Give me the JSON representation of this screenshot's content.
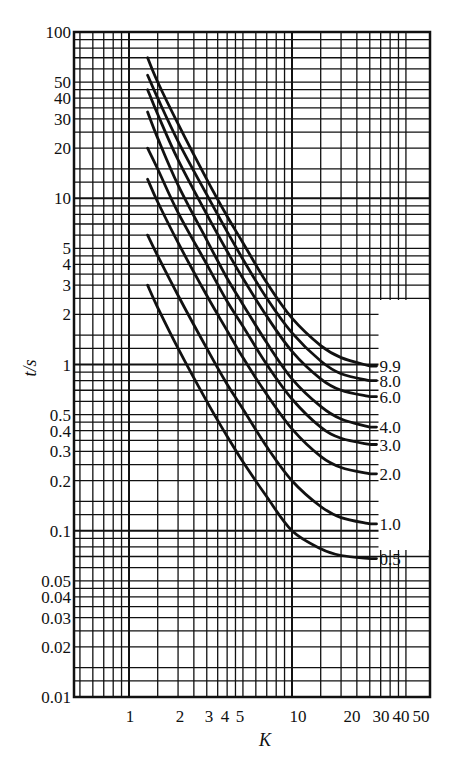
{
  "chart_data": {
    "type": "line",
    "title": "",
    "xlabel": "K",
    "ylabel": "t/s",
    "xscale": "log",
    "yscale": "log",
    "xlim": [
      0.45,
      50
    ],
    "ylim": [
      0.01,
      100
    ],
    "grid": true,
    "legend_position": "inline-right",
    "x_ticks": [
      1,
      2,
      3,
      4,
      5,
      10,
      20,
      30,
      40,
      50
    ],
    "x_tick_labels": [
      "1",
      "2",
      "3",
      "4",
      "5",
      "10",
      "20",
      "30",
      "40",
      "50"
    ],
    "y_ticks": [
      100,
      50,
      40,
      30,
      20,
      10,
      5,
      4,
      3,
      2,
      1,
      0.5,
      0.4,
      0.3,
      0.2,
      0.1,
      0.05,
      0.04,
      0.03,
      0.02,
      0.01
    ],
    "y_tick_labels": [
      "100",
      "50",
      "40",
      "30",
      "20",
      "10",
      "5",
      "4",
      "3",
      "2",
      "1",
      "0.5",
      "0.4",
      "0.3",
      "0.2",
      "0.1",
      "0.05",
      "0.04",
      "0.03",
      "0.02",
      "0.01"
    ],
    "x": [
      1.3,
      1.5,
      2,
      3,
      4,
      5,
      7,
      10,
      15,
      20,
      30
    ],
    "series": [
      {
        "name": "9.9",
        "values": [
          70,
          50,
          28,
          13,
          7.8,
          5.4,
          3.1,
          1.9,
          1.3,
          1.1,
          0.98
        ]
      },
      {
        "name": "8.0",
        "values": [
          55,
          40,
          22,
          10.5,
          6.3,
          4.3,
          2.5,
          1.55,
          1.05,
          0.88,
          0.8
        ]
      },
      {
        "name": "6.0",
        "values": [
          45,
          32,
          17,
          8,
          4.8,
          3.3,
          1.95,
          1.2,
          0.82,
          0.7,
          0.64
        ]
      },
      {
        "name": "4.0",
        "values": [
          33,
          23,
          12,
          5.6,
          3.3,
          2.3,
          1.35,
          0.82,
          0.56,
          0.47,
          0.42
        ]
      },
      {
        "name": "3.0",
        "values": [
          20,
          15,
          8.2,
          4,
          2.4,
          1.7,
          1.0,
          0.62,
          0.42,
          0.36,
          0.33
        ]
      },
      {
        "name": "2.0",
        "values": [
          13,
          9.5,
          5.4,
          2.6,
          1.6,
          1.1,
          0.66,
          0.41,
          0.28,
          0.24,
          0.22
        ]
      },
      {
        "name": "1.0",
        "values": [
          6,
          4.5,
          2.6,
          1.25,
          0.76,
          0.54,
          0.32,
          0.2,
          0.14,
          0.12,
          0.11
        ]
      },
      {
        "name": "0.5",
        "values": [
          3,
          2.2,
          1.25,
          0.6,
          0.37,
          0.26,
          0.16,
          0.1,
          0.078,
          0.071,
          0.068
        ]
      }
    ],
    "curve_labels": [
      "9.9",
      "8.0",
      "6.0",
      "4.0",
      "3.0",
      "2.0",
      "1.0",
      "0.5"
    ]
  },
  "colors": {
    "ink": "#111111",
    "background": "#ffffff"
  }
}
